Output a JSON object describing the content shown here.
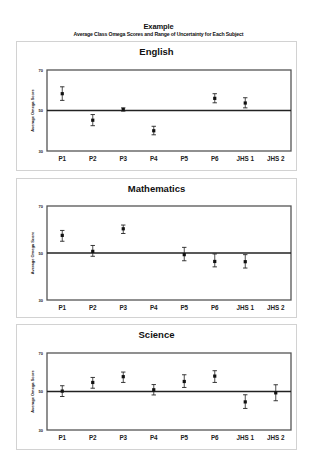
{
  "header": {
    "title": "Example",
    "subtitle": "Average Class Omega Scores and Range of Uncertainty for Each Subject"
  },
  "chart_data": [
    {
      "type": "scatter",
      "title": "English",
      "xlabel": "",
      "ylabel": "Average Omega Score",
      "ylim": [
        30,
        70
      ],
      "yticks": [
        30,
        50,
        70
      ],
      "reference_line": 50,
      "categories": [
        "P1",
        "P2",
        "P3",
        "P4",
        "P5",
        "P6",
        "JHS 1",
        "JHS 2"
      ],
      "values": [
        58.3,
        45.2,
        50.5,
        40.0,
        null,
        56.0,
        53.7,
        null
      ],
      "error_low": [
        55.0,
        42.5,
        49.7,
        38.0,
        null,
        53.8,
        51.3,
        null
      ],
      "error_high": [
        61.7,
        48.0,
        51.3,
        42.2,
        null,
        58.3,
        56.3,
        null
      ]
    },
    {
      "type": "scatter",
      "title": "Mathematics",
      "xlabel": "",
      "ylabel": "Average Omega Score",
      "ylim": [
        30,
        70
      ],
      "yticks": [
        30,
        50,
        70
      ],
      "reference_line": 50,
      "categories": [
        "P1",
        "P2",
        "P3",
        "P4",
        "P5",
        "P6",
        "JHS 1",
        "JHS 2"
      ],
      "values": [
        57.5,
        50.7,
        60.3,
        null,
        49.3,
        46.4,
        46.3,
        null
      ],
      "error_low": [
        55.0,
        48.6,
        58.3,
        null,
        46.7,
        44.1,
        43.6,
        null
      ],
      "error_high": [
        59.6,
        53.2,
        61.9,
        null,
        52.4,
        49.6,
        49.3,
        null
      ]
    },
    {
      "type": "scatter",
      "title": "Science",
      "xlabel": "",
      "ylabel": "Average Omega Score",
      "ylim": [
        30,
        70
      ],
      "yticks": [
        30,
        50,
        70
      ],
      "reference_line": 50,
      "categories": [
        "P1",
        "P2",
        "P3",
        "P4",
        "P5",
        "P6",
        "JHS 1",
        "JHS 2"
      ],
      "values": [
        50.2,
        54.7,
        57.7,
        50.9,
        55.2,
        58.0,
        44.6,
        49.3
      ],
      "error_low": [
        47.4,
        51.7,
        54.7,
        48.2,
        52.1,
        54.7,
        41.2,
        45.2
      ],
      "error_high": [
        53.0,
        57.3,
        60.1,
        53.6,
        58.7,
        60.8,
        48.3,
        53.5
      ]
    }
  ]
}
